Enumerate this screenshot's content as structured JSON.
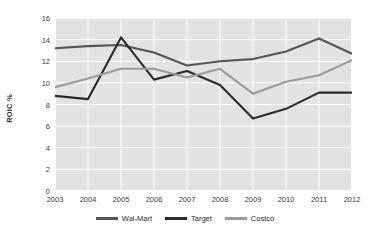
{
  "chart_data": {
    "type": "line",
    "title": "",
    "xlabel": "",
    "ylabel": "ROIC %",
    "grid": true,
    "legend_position": "bottom-center",
    "categories": [
      "2003",
      "2004",
      "2005",
      "2006",
      "2007",
      "2008",
      "2009",
      "2010",
      "2011",
      "2012"
    ],
    "xlim": [
      2003,
      2012
    ],
    "ylim": [
      0,
      16
    ],
    "yticks": [
      0,
      2,
      4,
      6,
      8,
      10,
      12,
      14,
      16
    ],
    "series": [
      {
        "name": "Wal-Mart",
        "color": "#555555",
        "values": [
          13.2,
          13.4,
          13.5,
          12.8,
          11.6,
          12.0,
          12.2,
          12.9,
          14.1,
          12.7
        ]
      },
      {
        "name": "Target",
        "color": "#2a2a2a",
        "values": [
          8.8,
          8.5,
          14.2,
          10.3,
          11.1,
          9.8,
          6.7,
          7.6,
          9.1,
          9.1
        ]
      },
      {
        "name": "Costco",
        "color": "#9a9a9a",
        "values": [
          9.6,
          10.4,
          11.3,
          11.3,
          10.5,
          11.3,
          9.0,
          10.1,
          10.7,
          12.1
        ]
      }
    ]
  },
  "axes": {
    "ylabel_text": "ROIC %",
    "ytick_labels": [
      "0",
      "2",
      "4",
      "6",
      "8",
      "10",
      "12",
      "14",
      "16"
    ],
    "xtick_labels": [
      "2003",
      "2004",
      "2005",
      "2006",
      "2007",
      "2008",
      "2009",
      "2010",
      "2011",
      "2012"
    ]
  },
  "legend": {
    "items": [
      {
        "label": "Wal-Mart",
        "color": "#555555"
      },
      {
        "label": "Target",
        "color": "#2a2a2a"
      },
      {
        "label": "Costco",
        "color": "#9a9a9a"
      }
    ]
  },
  "style": {
    "plot_background": "#e2e2e2",
    "page_background": "#ffffff",
    "gridline_color": "#ffffff",
    "axis_text_color": "#3a3a3a"
  }
}
